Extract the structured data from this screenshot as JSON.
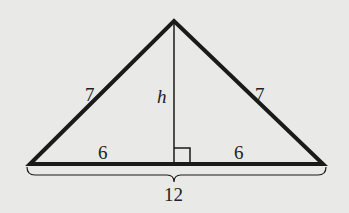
{
  "figure": {
    "type": "isosceles-triangle-with-altitude",
    "labels": {
      "left_side": "7",
      "right_side": "7",
      "height": "h",
      "left_base_half": "6",
      "right_base_half": "6",
      "base_total": "12"
    },
    "colors": {
      "background": "#e9e9e8",
      "stroke": "#1a1a1a"
    }
  }
}
